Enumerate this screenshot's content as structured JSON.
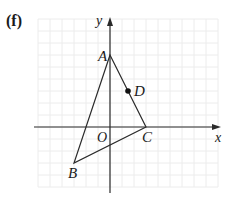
{
  "figure": {
    "part_label": "(f)",
    "axes": {
      "x_label": "x",
      "y_label": "y",
      "origin_label": "O"
    },
    "grid": {
      "unit_px": 12,
      "x_range": [
        -6,
        9
      ],
      "y_range": [
        -5,
        9
      ],
      "color": "#ececec"
    },
    "points": [
      {
        "name": "A",
        "x": 0,
        "y": 6
      },
      {
        "name": "B",
        "x": -3,
        "y": -3
      },
      {
        "name": "C",
        "x": 3,
        "y": 0
      },
      {
        "name": "D",
        "x": 1.5,
        "y": 3
      }
    ],
    "triangle": [
      "A",
      "B",
      "C"
    ],
    "marked_point": "D",
    "colors": {
      "line": "#2a2a2a",
      "axis": "#2a2a2a",
      "grid": "#ececec"
    }
  }
}
